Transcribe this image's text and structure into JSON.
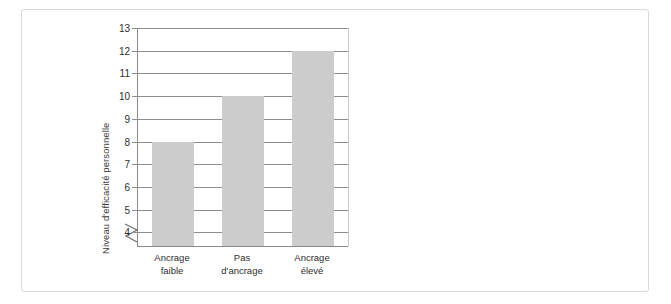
{
  "figure": {
    "background": "#ffffff",
    "frame_color": "#d9d9d9",
    "bar_color": "#cccccc",
    "grid_color": "#8d8d8d",
    "axis_color": "#8a8a8a"
  },
  "chart_data": [
    {
      "type": "bar",
      "id": "efficacite",
      "title": "",
      "xlabel": "",
      "ylabel": "Niveau d'efficacité personnelle",
      "categories": [
        "Ancrage faible",
        "Pas d'ancrage",
        "Ancrage élevé"
      ],
      "category_lines": [
        [
          "Ancrage",
          "faible"
        ],
        [
          "Pas",
          "d'ancrage"
        ],
        [
          "Ancrage",
          "élevé"
        ]
      ],
      "values": [
        8,
        10,
        12
      ],
      "ylim": [
        3.4,
        13
      ],
      "yticks": [
        4,
        5,
        6,
        7,
        8,
        9,
        10,
        11,
        12,
        13
      ],
      "ytick_labels": [
        "4",
        "5",
        "6",
        "7",
        "8",
        "9",
        "10",
        "11",
        "12",
        "13"
      ],
      "grid": true,
      "axis_break": true,
      "legend": null
    },
    {
      "type": "bar",
      "id": "perseverance",
      "title": "",
      "xlabel": "",
      "ylabel": "Degré de persévérance",
      "categories": [
        "Ancrage faible",
        "Pas d'ancrage",
        "Ancrage élevé"
      ],
      "category_lines": [
        [
          "Ancrage",
          "faible"
        ],
        [
          "Pas",
          "d'ancrage"
        ],
        [
          "Ancrage",
          "élevé"
        ]
      ],
      "values": [
        17.5,
        20.8,
        30.6
      ],
      "ylim": [
        0,
        34
      ],
      "yticks": [
        5,
        10,
        15,
        20,
        25,
        30
      ],
      "ytick_labels": [
        "5",
        "10",
        "15",
        "20",
        "25",
        "30"
      ],
      "grid": true,
      "axis_break": false,
      "legend": null
    }
  ]
}
